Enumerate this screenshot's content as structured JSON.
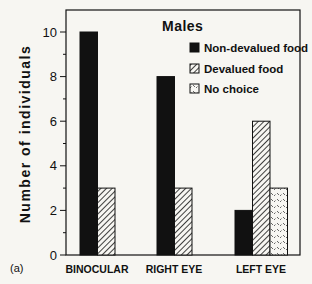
{
  "chart_data": {
    "type": "bar",
    "title": "Males",
    "panel_label": "(a)",
    "xlabel": "",
    "ylabel": "Number of individuals",
    "ylim": [
      0,
      10
    ],
    "yticks": [
      0,
      2,
      4,
      6,
      8,
      10
    ],
    "categories": [
      "BINOCULAR",
      "RIGHT EYE",
      "LEFT EYE"
    ],
    "series": [
      {
        "name": "Non-devalued food",
        "pattern": "solid",
        "values": [
          10,
          8,
          2
        ]
      },
      {
        "name": "Devalued food",
        "pattern": "hatched",
        "values": [
          3,
          3,
          6
        ]
      },
      {
        "name": "No choice",
        "pattern": "dotted",
        "values": [
          0,
          0,
          3
        ]
      }
    ],
    "legend_position": "upper right inside",
    "grid": false
  },
  "colors": {
    "background": "#f7f6f2",
    "ink": "#111111"
  }
}
